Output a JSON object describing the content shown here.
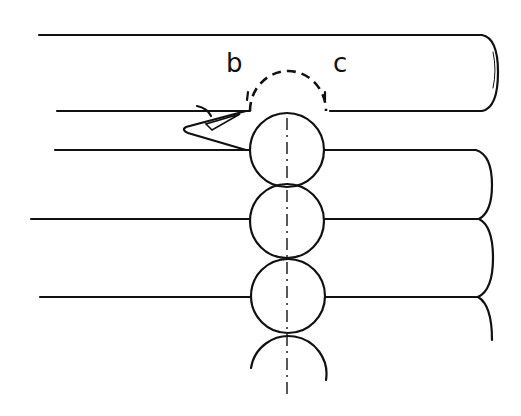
{
  "diagram": {
    "labels": {
      "b": "b",
      "c": "c"
    },
    "colors": {
      "line": "#111111",
      "background": "#ffffff"
    }
  }
}
